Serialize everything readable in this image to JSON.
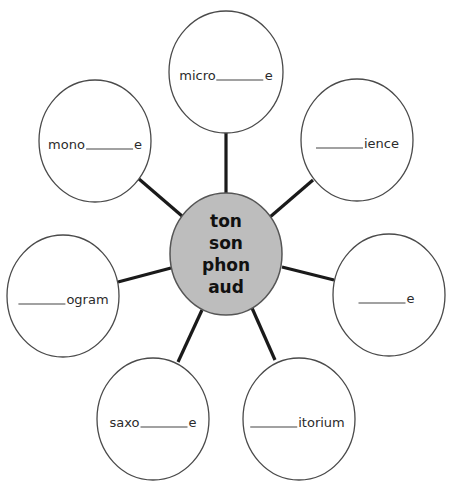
{
  "diagram": {
    "type": "word-web",
    "center": {
      "roots": [
        "ton",
        "son",
        "phon",
        "aud"
      ],
      "fill_color": "#bdbdbd"
    },
    "nodes": [
      {
        "position": "top",
        "prefix": "micro",
        "suffix": "e"
      },
      {
        "position": "upper-right",
        "prefix": "",
        "suffix": "ience"
      },
      {
        "position": "right",
        "prefix": "",
        "suffix": "e"
      },
      {
        "position": "lower-right",
        "prefix": "",
        "suffix": "itorium"
      },
      {
        "position": "lower-left",
        "prefix": "saxo",
        "suffix": "e"
      },
      {
        "position": "left",
        "prefix": "",
        "suffix": "ogram"
      },
      {
        "position": "upper-left",
        "prefix": "mono",
        "suffix": "e"
      }
    ]
  }
}
